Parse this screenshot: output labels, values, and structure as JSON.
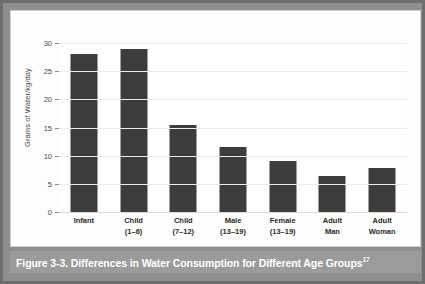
{
  "figure": {
    "caption_text": "Figure 3-3. Differences in Water Consumption for Different Age Groups",
    "caption_reference": "17",
    "caption_bar_color": "#9b9b9b",
    "frame_color": "#6e6e6e",
    "panel_color": "#fdfdfd"
  },
  "chart_data": {
    "type": "bar",
    "title": "",
    "xlabel": "",
    "ylabel": "Grams of Water/kg/day",
    "ylim": [
      0,
      30
    ],
    "yticks": [
      0,
      5,
      10,
      15,
      20,
      25,
      30
    ],
    "ytick_labels": [
      "0",
      "5",
      "10",
      "15",
      "20",
      "25",
      "30"
    ],
    "grid": true,
    "legend": false,
    "bar_color": "#3d3d3d",
    "categories": [
      "Infant",
      "Child (1–6)",
      "Child (7–12)",
      "Male (13–19)",
      "Female (13–19)",
      "Adult Man",
      "Adult Woman"
    ],
    "category_lines": [
      {
        "line1": "Infant",
        "line2": ""
      },
      {
        "line1": "Child",
        "line2": "(1–6)"
      },
      {
        "line1": "Child",
        "line2": "(7–12)"
      },
      {
        "line1": "Male",
        "line2": "(13–19)"
      },
      {
        "line1": "Female",
        "line2": "(13–19)"
      },
      {
        "line1": "Adult",
        "line2": "Man"
      },
      {
        "line1": "Adult",
        "line2": "Woman"
      }
    ],
    "values": [
      28.0,
      29.0,
      15.5,
      11.6,
      9.1,
      6.4,
      7.8
    ]
  }
}
